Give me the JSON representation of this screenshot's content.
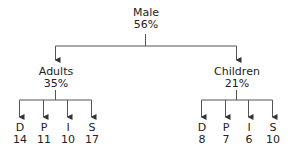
{
  "root": {
    "label": "Male",
    "value": "56%"
  },
  "groups": [
    {
      "label": "Adults",
      "value": "35%",
      "leaves": [
        {
          "label": "D",
          "value": "14"
        },
        {
          "label": "P",
          "value": "11"
        },
        {
          "label": "I",
          "value": "10"
        },
        {
          "label": "S",
          "value": "17"
        }
      ]
    },
    {
      "label": "Children",
      "value": "21%",
      "leaves": [
        {
          "label": "D",
          "value": "8"
        },
        {
          "label": "P",
          "value": "7"
        },
        {
          "label": "I",
          "value": "6"
        },
        {
          "label": "S",
          "value": "10"
        }
      ]
    }
  ],
  "colors": {
    "line": "#333333",
    "text": "#222222"
  }
}
